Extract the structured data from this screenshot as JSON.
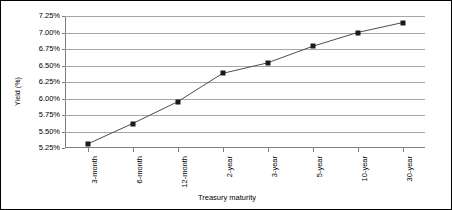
{
  "chart_data": {
    "type": "line",
    "title": "",
    "xlabel": "Treasury maturity",
    "ylabel": "Yield (%)",
    "categories": [
      "3-month",
      "6-month",
      "12-month",
      "2-year",
      "3-year",
      "5-year",
      "10-year",
      "30-year"
    ],
    "values": [
      5.31,
      5.62,
      5.95,
      6.38,
      6.54,
      6.79,
      7.0,
      7.15
    ],
    "series": [
      {
        "name": "Yield",
        "values": [
          5.31,
          5.62,
          5.95,
          6.38,
          6.54,
          6.79,
          7.0,
          7.15
        ]
      }
    ],
    "ytick_labels": [
      "5.25%",
      "5.50%",
      "5.75%",
      "6.00%",
      "6.25%",
      "6.50%",
      "6.75%",
      "7.00%",
      "7.25%"
    ],
    "ytick_values": [
      5.25,
      5.5,
      5.75,
      6.0,
      6.25,
      6.5,
      6.75,
      7.0,
      7.25
    ],
    "ylim": [
      5.25,
      7.25
    ],
    "grid": true,
    "legend": "none",
    "marker_style": "square",
    "marker_color": "#1a1a1a",
    "line_color": "#4d4d4d",
    "gridline_color": "#a6a6a6",
    "axis_color": "#808080",
    "background_color": "#ffffff",
    "border_color": "#000000"
  }
}
